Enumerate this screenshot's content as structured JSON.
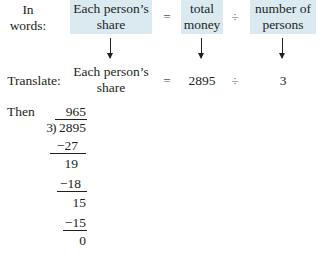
{
  "words_row": {
    "label_line1": "In",
    "label_line2": "words:",
    "term1_line1": "Each person’s",
    "term1_line2": "share",
    "equals": "=",
    "term2_line1": "total",
    "term2_line2": "money",
    "divide": "÷",
    "term3_line1": "number of",
    "term3_line2": "persons"
  },
  "translate_row": {
    "label": "Translate:",
    "term1_line1": "Each person’s",
    "term1_line2": "share",
    "equals": "=",
    "dividend": "2895",
    "divide": "÷",
    "divisor": "3"
  },
  "long_division": {
    "label": "Then",
    "quotient": "965",
    "divisor": "3",
    "dividend": "2895",
    "steps": [
      {
        "subtract": "−27",
        "remainder": "19"
      },
      {
        "subtract": "−18",
        "remainder": "15"
      },
      {
        "subtract": "−15",
        "remainder": "0"
      }
    ]
  },
  "colors": {
    "highlight_box": "#dbe9f0",
    "text": "#231f20"
  }
}
